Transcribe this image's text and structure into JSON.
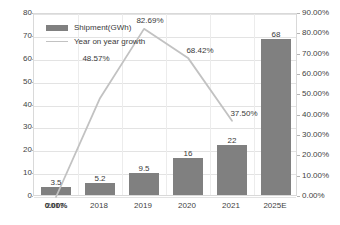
{
  "chart_data": {
    "type": "bar",
    "title": "",
    "subtitle": "",
    "xlabel": "",
    "ylabel": "",
    "grid": true,
    "legend_position": "top-left-inside",
    "categories": [
      "2017",
      "2018",
      "2019",
      "2020",
      "2021",
      "2025E"
    ],
    "series": [
      {
        "name": "Shipment(GWh)",
        "type": "bar",
        "axis": "left",
        "color": "#808080",
        "values": [
          3.5,
          5.2,
          9.5,
          16,
          22,
          68
        ],
        "value_labels": [
          "3.5",
          "5.2",
          "9.5",
          "16",
          "22",
          "68"
        ]
      },
      {
        "name": "Year on year growth",
        "type": "line",
        "axis": "right",
        "color": "#c2c2c2",
        "values": [
          0.0,
          48.57,
          82.69,
          68.42,
          37.5,
          null
        ],
        "value_labels": [
          "0.00%",
          "48.57%",
          "82.69%",
          "68.42%",
          "37.50%",
          ""
        ]
      }
    ],
    "y_left": {
      "min": 0,
      "max": 80,
      "step": 10,
      "ticks": [
        "0",
        "10",
        "20",
        "30",
        "40",
        "50",
        "60",
        "70",
        "80"
      ]
    },
    "y_right": {
      "min": 0,
      "max": 90,
      "step": 10,
      "ticks": [
        "0.00%",
        "10.00%",
        "20.00%",
        "30.00%",
        "40.00%",
        "50.00%",
        "60.00%",
        "70.00%",
        "80.00%",
        "90.00%"
      ]
    }
  },
  "legend": {
    "items": [
      {
        "label": "Shipment(GWh)"
      },
      {
        "label": "Year on year growth"
      }
    ]
  },
  "colors": {
    "bar": "#808080",
    "line": "#c2c2c2",
    "grid": "#e3e3e3",
    "axis_text": "#3f3f3f",
    "background": "#ffffff"
  }
}
